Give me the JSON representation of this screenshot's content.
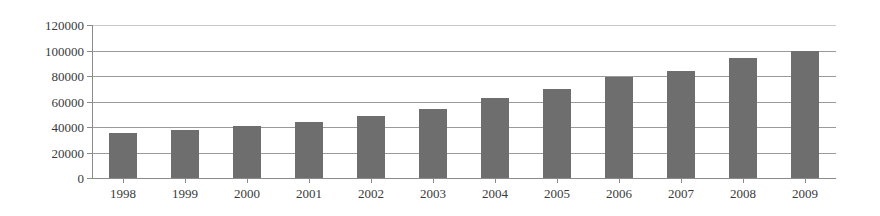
{
  "chart_data": {
    "type": "bar",
    "title": "",
    "subtitle": "",
    "xlabel": "",
    "ylabel": "",
    "categories": [
      "1998",
      "1999",
      "2000",
      "2001",
      "2002",
      "2003",
      "2004",
      "2005",
      "2006",
      "2007",
      "2008",
      "2009"
    ],
    "values": [
      35000,
      38000,
      41000,
      44000,
      48500,
      54500,
      62500,
      69500,
      79500,
      84000,
      94000,
      100000
    ],
    "ylim": [
      0,
      120000
    ],
    "ytick_values": [
      0,
      20000,
      40000,
      60000,
      80000,
      100000,
      120000
    ],
    "ytick_labels": [
      "0",
      "20000",
      "40000",
      "60000",
      "80000",
      "100000",
      "120000"
    ],
    "grid": true,
    "grid_axis": "y",
    "legend": false,
    "legend_position": "none",
    "series": [
      {
        "name": "",
        "values": [
          35000,
          38000,
          41000,
          44000,
          48500,
          54500,
          62500,
          69500,
          79500,
          84000,
          94000,
          100000
        ]
      }
    ],
    "colors": {
      "bar_fill": "#6e6e6e",
      "gridline": "#9a9a9a",
      "top_gridline": "#c9c9c9",
      "axis": "#8a8a8a",
      "text": "#3a3a3a",
      "background": "#ffffff"
    }
  }
}
